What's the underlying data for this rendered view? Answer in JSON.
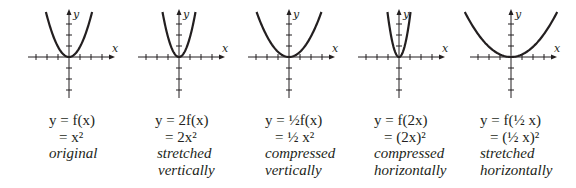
{
  "figure": {
    "panels": [
      {
        "id": "original",
        "eq_line1": "y = f(x)",
        "eq_line2": "= x²",
        "desc_line1": "original",
        "desc_line2": "",
        "x_label": "x",
        "y_label": "y",
        "formula": "x^2",
        "a": 1,
        "b": 1
      },
      {
        "id": "stretched-vertically",
        "eq_line1": "y = 2f(x)",
        "eq_line2": "= 2x²",
        "desc_line1": "stretched",
        "desc_line2": "vertically",
        "x_label": "x",
        "y_label": "y",
        "formula": "2x^2",
        "a": 2,
        "b": 1
      },
      {
        "id": "compressed-vertically",
        "eq_line1": "y = ½f(x)",
        "eq_line2": "= ½ x²",
        "desc_line1": "compressed",
        "desc_line2": "vertically",
        "x_label": "x",
        "y_label": "y",
        "formula": "(1/2)x^2",
        "a": 0.5,
        "b": 1
      },
      {
        "id": "compressed-horizontally",
        "eq_line1": "y = f(2x)",
        "eq_line2": "= (2x)²",
        "desc_line1": "compressed",
        "desc_line2": "horizontally",
        "x_label": "x",
        "y_label": "y",
        "formula": "(2x)^2",
        "a": 1,
        "b": 2
      },
      {
        "id": "stretched-horizontally",
        "eq_line1": "y = f(½ x)",
        "eq_line2": "= (½ x)²",
        "desc_line1": "stretched",
        "desc_line2": "horizontally",
        "x_label": "x",
        "y_label": "y",
        "formula": "((1/2)x)^2",
        "a": 1,
        "b": 0.5
      }
    ],
    "colors": {
      "ink": "#231f20",
      "background": "#ffffff"
    }
  }
}
